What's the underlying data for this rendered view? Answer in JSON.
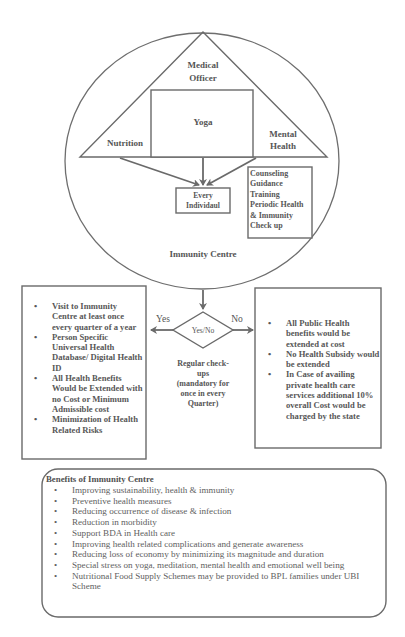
{
  "header_fragment": "",
  "diagram": {
    "circle_label": "Immunity Centre",
    "triangle": {
      "apex_label_line1": "Medical",
      "apex_label_line2": "Officer",
      "left_label": "Nutrition",
      "right_label_line1": "Mental",
      "right_label_line2": "Health",
      "center_box_label": "Yoga"
    },
    "target_box": {
      "line1": "Every",
      "line2": "Individaul"
    },
    "services_box": {
      "lines": [
        "Counseling",
        "Guidance",
        "Training",
        "Periodic Health",
        "& Immunity",
        "Check up"
      ]
    },
    "decision": {
      "label": "Yes/No",
      "yes_label": "Yes",
      "no_label": "No",
      "caption_lines": [
        "Regular check-",
        "ups",
        "(mandatory for",
        "once in every",
        "Quarter)"
      ]
    },
    "yes_box": {
      "items": [
        "Visit to Immunity Centre at least once every quarter of a year",
        "Person Specific Universal Health Database/ Digital Health ID",
        "All Health Benefits Would be Extended with no Cost or Minimum Admissible cost",
        "Minimization of Health Related Risks"
      ]
    },
    "no_box": {
      "items": [
        "All Public Health benefits would be extended at cost",
        "No Health Subsidy would be extended",
        "In Case of availing private health care services additional 10% overall Cost would be charged by the state"
      ]
    },
    "benefits": {
      "title": "Benefits of Immunity Centre",
      "items": [
        "Improving sustainability, health & immunity",
        "Preventive health measures",
        "Reducing occurrence of disease & infection",
        "Reduction in morbidity",
        "Support BDA in Health care",
        "Improving health related complications and generate awareness",
        "Reducing loss of economy by minimizing its magnitude and duration",
        "Special stress on yoga, meditation, mental health and emotional well being",
        "Nutritional Food Supply Schemes may be provided to BPL families under UBI Scheme"
      ]
    }
  },
  "colors": {
    "line": "#6a6a6a",
    "text": "#555555",
    "background": "#ffffff"
  }
}
